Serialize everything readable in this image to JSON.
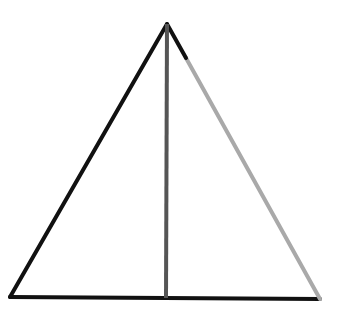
{
  "diagram": {
    "type": "triangle-with-vertical-segment",
    "background": "#ffffff",
    "points": {
      "apex": [
        167,
        24
      ],
      "bottom_left": [
        10,
        297
      ],
      "bottom_right": [
        320,
        299
      ],
      "foot": [
        166,
        298
      ],
      "right_edge_break": [
        186,
        58
      ]
    },
    "segments": [
      {
        "name": "left-side",
        "from": "apex",
        "to": "bottom_left",
        "color": "#111111",
        "width": 4
      },
      {
        "name": "base",
        "from": "bottom_left",
        "to": "bottom_right",
        "color": "#111111",
        "width": 4
      },
      {
        "name": "right-side-upper",
        "from": "apex",
        "to": "right_edge_break",
        "color": "#111111",
        "width": 4
      },
      {
        "name": "right-side-lower",
        "from": "right_edge_break",
        "to": "bottom_right",
        "color": "#a9a9a9",
        "width": 4
      },
      {
        "name": "vertical-segment",
        "from": "apex",
        "to": "foot",
        "color": "#555555",
        "width": 4
      }
    ]
  }
}
